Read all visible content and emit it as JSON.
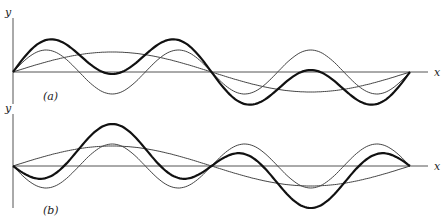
{
  "figure": {
    "panels": [
      {
        "id": "a",
        "label": "(a)",
        "y_axis_label": "y",
        "x_axis_label": "x",
        "axis_y": 72,
        "origin_x": 13,
        "end_x": 410,
        "components": [
          {
            "name": "fundamental",
            "style": "thin",
            "harmonic": 1,
            "amplitude": 20,
            "sign": 1
          },
          {
            "name": "third-harmonic",
            "style": "thin",
            "harmonic": 3,
            "amplitude": 22,
            "sign": 1
          },
          {
            "name": "resultant",
            "style": "thick",
            "is_sum": true
          }
        ]
      },
      {
        "id": "b",
        "label": "(b)",
        "y_axis_label": "y",
        "x_axis_label": "x",
        "axis_y": 166,
        "origin_x": 13,
        "end_x": 410,
        "components": [
          {
            "name": "fundamental",
            "style": "thin",
            "harmonic": 1,
            "amplitude": 20,
            "sign": 1
          },
          {
            "name": "third-harmonic",
            "style": "thin",
            "harmonic": 3,
            "amplitude": 22,
            "sign": -1
          },
          {
            "name": "resultant",
            "style": "thick",
            "is_sum": true
          }
        ]
      }
    ]
  }
}
